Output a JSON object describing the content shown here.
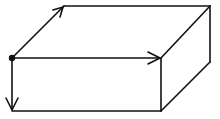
{
  "diagram": {
    "type": "rectangular-box-axes",
    "background": "#ffffff",
    "stroke": "#111111",
    "stroke_width": 1.6,
    "origin_dot": {
      "x": 12,
      "y": 58,
      "r": 3.2
    },
    "box": {
      "front_top_left": [
        12,
        58
      ],
      "front_top_right": [
        161,
        58
      ],
      "front_bottom_left": [
        12,
        111
      ],
      "front_bottom_right": [
        161,
        111
      ],
      "back_top_left": [
        64,
        6
      ],
      "back_top_right": [
        210,
        6
      ],
      "back_bottom_right": [
        210,
        62
      ]
    },
    "arrows": [
      {
        "name": "depth-axis-arrow",
        "from": [
          12,
          58
        ],
        "to": [
          64,
          6
        ]
      },
      {
        "name": "width-axis-arrow",
        "from": [
          12,
          58
        ],
        "to": [
          161,
          58
        ]
      },
      {
        "name": "height-axis-arrow",
        "from": [
          12,
          58
        ],
        "to": [
          12,
          111
        ]
      }
    ]
  }
}
